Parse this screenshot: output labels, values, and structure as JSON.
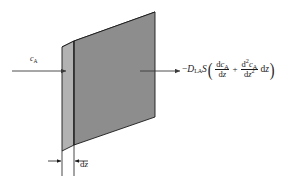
{
  "figure": {
    "inlet": {
      "symbol": "c",
      "subscript": "A"
    },
    "thickness": {
      "d": "d",
      "z": "z"
    },
    "outlet_flux": {
      "minus": "−",
      "D": "D",
      "D_sub": "LA",
      "S": "S",
      "open_paren": "(",
      "term1_num_d": "d",
      "term1_num_c": "c",
      "term1_num_sub": "A",
      "term1_den_d": "d",
      "term1_den_z": "z",
      "plus": "+",
      "term2_num_d": "d",
      "term2_num_sup": "2",
      "term2_num_c": "c",
      "term2_num_sub": "A",
      "term2_den_d": "d",
      "term2_den_z": "z",
      "term2_den_sup": "2",
      "trailing_d": "d",
      "trailing_z": "z",
      "close_paren": ")"
    },
    "colors": {
      "front_face": "#8d8d8d",
      "side_face": "#b2b2b2",
      "top_face": "#6e6e6e",
      "outline": "#1a1a1a",
      "arrow": "#3a3a3a",
      "background": "#ffffff"
    },
    "geometry": {
      "front_top_left_x": 74,
      "front_top_left_y": 41,
      "front_top_right_x": 155,
      "front_top_right_y": 12,
      "front_bottom_left_y": 145,
      "front_bottom_right_y": 117,
      "side_left_x": 62,
      "depth_dx": 12,
      "depth_dy": -6
    }
  }
}
